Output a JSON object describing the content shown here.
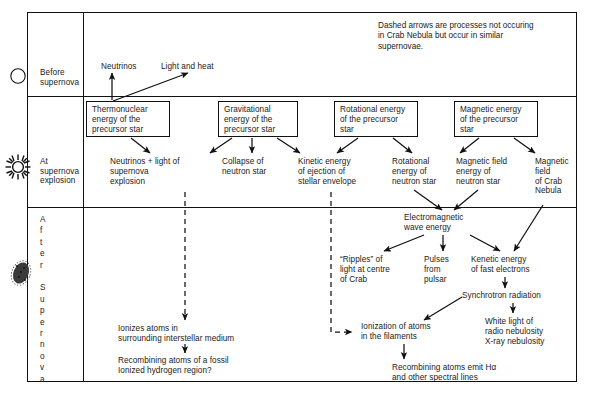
{
  "legend": {
    "note": "Dashed arrows are processes not occuring\nin Crab Nebula but occur in similar\nsupernovae."
  },
  "stages": [
    {
      "id": "before",
      "label": "Before\nsupernova",
      "icon": "circle-star-icon"
    },
    {
      "id": "at",
      "label": "At\nsupernova\nexplosion",
      "icon": "starburst-icon"
    },
    {
      "id": "after",
      "label": "A\nf\nt\ne\nr\n\nS\nu\np\ne\nr\nn\no\nv\na",
      "icon": "nebula-blob-icon"
    }
  ],
  "nodes": {
    "neutrinos_top": "Neutrinos",
    "light_and_heat": "Light and heat",
    "thermonuclear": "Thermonuclear\nenergy of the\nprecursor star",
    "gravitational": "Gravitational\nenergy of the\nprecursor star",
    "rotational_precursor": "Rotational energy\nof the precursor\nstar",
    "magnetic_precursor": "Magnetic energy\nof the precursor\nstar",
    "neutrinos_light": "Neutrinos + light of\nsupernova\nexplosion",
    "collapse": "Collapse of\nneutron star",
    "kinetic_ejection": "Kinetic energy\nof ejection of\nstellar envelope",
    "rotational_neutron": "Rotational\nenergy of\nneutron star",
    "magnetic_field_energy": "Magnetic field\nenergy of\nneutron star",
    "magnetic_field_crab": "Magnetic\nfield\nof Crab\nNebula",
    "em_wave": "Electromagnetic\nwave energy",
    "ripples": "“Ripples” of\nlight at centre\nof Crab",
    "pulses": "Pulses\nfrom\npulsar",
    "kenetic_fast": "Kenetic energy\nof fast electrons",
    "synchrotron": "Synchrotron radiation",
    "white_light": "White light of\nradio nebulosity\nX-ray nebulosity",
    "ionization_filaments": "Ionization of atoms\nin the filaments",
    "recombining_halpha": "Recombining atoms emit Hα\nand other spectral lines",
    "ionizes_ism": "Ionizes atoms in\nsurrounding interstellar medium",
    "recombining_fossil": "Recombining atoms of a fossil\nIonized hydrogen region?"
  },
  "colors": {
    "stroke": "#111111",
    "background": "#ffffff",
    "text": "#1a1a1a"
  }
}
